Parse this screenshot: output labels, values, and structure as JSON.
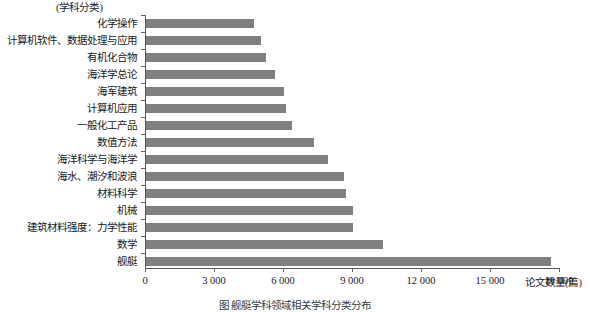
{
  "chart_data": {
    "type": "bar",
    "orientation": "horizontal",
    "title": "",
    "xlabel": "论文数量(篇)",
    "ylabel": "(学科分类)",
    "xlim": [
      0,
      18000
    ],
    "xticks": [
      0,
      3000,
      6000,
      9000,
      12000,
      15000,
      18000
    ],
    "xtick_labels": [
      "0",
      "3 000",
      "6 000",
      "9 000",
      "12 000",
      "15 000",
      "18 000"
    ],
    "grid": false,
    "legend": null,
    "bar_color": "#808080",
    "axis_color": "#555555",
    "categories": [
      "化学操作",
      "计算机软件、数据处理与应用",
      "有机化合物",
      "海洋学总论",
      "海军建筑",
      "计算机应用",
      "一般化工产品",
      "数值方法",
      "海洋科学与海洋学",
      "海水、潮汐和波浪",
      "材料科学",
      "机械",
      "建筑材料强度：力学性能",
      "数学",
      "舰艇"
    ],
    "values": [
      4700,
      5000,
      5200,
      5600,
      6000,
      6100,
      6350,
      7300,
      7900,
      8600,
      8700,
      9000,
      9000,
      10300,
      17600
    ]
  },
  "caption": {
    "text": "图  舰艇学科领域相关学科分类分布"
  }
}
